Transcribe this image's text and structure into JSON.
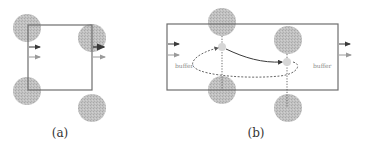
{
  "colors": {
    "frame": "#6e6e6e",
    "circle_fill": "#bdbdbd",
    "small_circle_fill": "#d6d6d6",
    "arrow_dark": "#3a3a3a",
    "arrow_light": "#9a9a9a",
    "dotted": "#555555"
  },
  "panels": [
    {
      "id": "a",
      "caption": "(a)",
      "rect": {
        "x": 28,
        "y": 25,
        "w": 64,
        "h": 65
      },
      "circles": [
        {
          "cx": 27,
          "cy": 28,
          "r": 14
        },
        {
          "cx": 92,
          "cy": 38,
          "r": 14
        },
        {
          "cx": 27,
          "cy": 91,
          "r": 14
        },
        {
          "cx": 92,
          "cy": 108,
          "r": 14
        }
      ]
    },
    {
      "id": "b",
      "caption": "(b)",
      "rect": {
        "x": 167,
        "y": 24,
        "w": 171,
        "h": 66
      },
      "labels": {
        "left_buffer": "buffer",
        "right_buffer": "buffer"
      },
      "circles": [
        {
          "cx": 222,
          "cy": 22,
          "r": 14
        },
        {
          "cx": 288,
          "cy": 40,
          "r": 14
        },
        {
          "cx": 222,
          "cy": 90,
          "r": 14
        },
        {
          "cx": 288,
          "cy": 108,
          "r": 14
        }
      ],
      "small_circles": [
        {
          "cx": 222,
          "cy": 47,
          "r": 4
        },
        {
          "cx": 287,
          "cy": 62,
          "r": 4
        }
      ]
    }
  ]
}
